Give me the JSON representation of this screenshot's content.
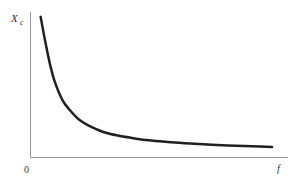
{
  "figure": {
    "background_color": "#ffffff",
    "curve_color": "#231f20",
    "axis_color": "#9a9a9a",
    "text_color": "#2b2b2b"
  },
  "labels": {
    "y_axis_symbol": "X",
    "y_axis_subscript": "c",
    "x_axis_symbol": "f",
    "origin": "0"
  },
  "chart_data": {
    "type": "line",
    "title": "",
    "subtitle": "",
    "xlabel": "f",
    "ylabel": "Xc",
    "x_tick_labels": [
      "0"
    ],
    "y_tick_labels": [],
    "grid": false,
    "legend": null,
    "legend_position": "none",
    "xlim": [
      0,
      1
    ],
    "ylim": [
      0,
      1
    ],
    "annotations": [],
    "series": [
      {
        "name": "Xc",
        "description": "Capacitive reactance decreasing hyperbolically with frequency",
        "x": [
          0.04,
          0.06,
          0.08,
          0.1,
          0.13,
          0.16,
          0.2,
          0.25,
          0.3,
          0.36,
          0.43,
          0.5,
          0.58,
          0.66,
          0.75,
          0.85,
          0.95,
          1.0
        ],
        "y": [
          0.98,
          0.8,
          0.64,
          0.52,
          0.4,
          0.33,
          0.26,
          0.21,
          0.175,
          0.15,
          0.13,
          0.115,
          0.103,
          0.094,
          0.086,
          0.079,
          0.073,
          0.07
        ]
      }
    ]
  }
}
